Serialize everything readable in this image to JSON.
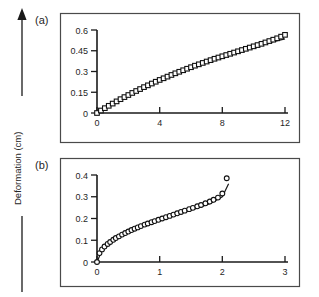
{
  "figure": {
    "shared_axis_label": "Deformation (cm)",
    "ink_color": "#1a1a1a",
    "frame_color": "#4a4a4a",
    "background": "#ffffff"
  },
  "panels": [
    {
      "letter": "(a)",
      "marker": "square",
      "yticklabels": [
        "0",
        "0.15",
        "0.3",
        "0.45",
        "0.6"
      ],
      "xticklabels": [
        "0",
        "4",
        "8",
        "12"
      ]
    },
    {
      "letter": "(b)",
      "marker": "circle",
      "yticklabels": [
        "0",
        "0.1",
        "0.2",
        "0.3",
        "0.4"
      ],
      "xticklabels": [
        "0",
        "1",
        "2",
        "3"
      ]
    }
  ],
  "chart_data": [
    {
      "type": "scatter",
      "title": "(a)",
      "xlabel": "",
      "ylabel": "Deformation (cm)",
      "xlim": [
        0,
        12
      ],
      "ylim": [
        0,
        0.6
      ],
      "xticks": [
        0,
        4,
        8,
        12
      ],
      "yticks": [
        0,
        0.15,
        0.3,
        0.45,
        0.6
      ],
      "grid": false,
      "legend": "none",
      "series": [
        {
          "name": "experimental data",
          "style": "open-square-markers",
          "x": [
            0,
            0.25,
            0.5,
            0.75,
            1,
            1.25,
            1.5,
            1.75,
            2,
            2.25,
            2.5,
            2.75,
            3,
            3.25,
            3.5,
            3.75,
            4,
            4.25,
            4.5,
            4.75,
            5,
            5.25,
            5.5,
            5.75,
            6,
            6.25,
            6.5,
            6.75,
            7,
            7.25,
            7.5,
            7.75,
            8,
            8.25,
            8.5,
            8.75,
            9,
            9.25,
            9.5,
            9.75,
            10,
            10.25,
            10.5,
            10.75,
            11,
            11.25,
            11.5,
            11.75,
            12
          ],
          "y": [
            0,
            0.018,
            0.035,
            0.052,
            0.068,
            0.084,
            0.1,
            0.115,
            0.13,
            0.145,
            0.159,
            0.173,
            0.187,
            0.2,
            0.213,
            0.226,
            0.239,
            0.251,
            0.263,
            0.275,
            0.287,
            0.298,
            0.309,
            0.32,
            0.331,
            0.342,
            0.352,
            0.362,
            0.372,
            0.382,
            0.392,
            0.401,
            0.41,
            0.419,
            0.428,
            0.437,
            0.446,
            0.455,
            0.464,
            0.473,
            0.482,
            0.491,
            0.5,
            0.51,
            0.52,
            0.53,
            0.54,
            0.552,
            0.565
          ]
        },
        {
          "name": "model fit",
          "style": "solid-line",
          "x": [
            0,
            1,
            2,
            3,
            4,
            5,
            6,
            7,
            8,
            9,
            10,
            11,
            12
          ],
          "y": [
            0,
            0.066,
            0.128,
            0.186,
            0.24,
            0.29,
            0.335,
            0.375,
            0.412,
            0.446,
            0.478,
            0.508,
            0.536
          ]
        }
      ]
    },
    {
      "type": "scatter",
      "title": "(b)",
      "xlabel": "",
      "ylabel": "Deformation (cm)",
      "xlim": [
        0,
        3
      ],
      "ylim": [
        0,
        0.4
      ],
      "xticks": [
        0,
        1,
        2,
        3
      ],
      "yticks": [
        0,
        0.1,
        0.2,
        0.3,
        0.4
      ],
      "grid": false,
      "legend": "none",
      "series": [
        {
          "name": "experimental data",
          "style": "open-circle-markers",
          "x": [
            0,
            0.04,
            0.08,
            0.12,
            0.17,
            0.21,
            0.26,
            0.3,
            0.35,
            0.4,
            0.45,
            0.5,
            0.55,
            0.6,
            0.65,
            0.7,
            0.76,
            0.81,
            0.87,
            0.92,
            0.98,
            1.04,
            1.1,
            1.16,
            1.22,
            1.28,
            1.34,
            1.4,
            1.47,
            1.53,
            1.6,
            1.66,
            1.73,
            1.8,
            1.86,
            1.93,
            2,
            2.07
          ],
          "y": [
            0,
            0.041,
            0.058,
            0.071,
            0.083,
            0.092,
            0.102,
            0.11,
            0.118,
            0.126,
            0.133,
            0.14,
            0.147,
            0.153,
            0.159,
            0.165,
            0.172,
            0.177,
            0.183,
            0.188,
            0.194,
            0.2,
            0.206,
            0.212,
            0.218,
            0.224,
            0.23,
            0.236,
            0.243,
            0.249,
            0.256,
            0.262,
            0.27,
            0.278,
            0.286,
            0.296,
            0.315,
            0.385
          ]
        },
        {
          "name": "model fit",
          "style": "solid-line",
          "x": [
            0,
            0.1,
            0.2,
            0.3,
            0.4,
            0.5,
            0.6,
            0.7,
            0.8,
            0.9,
            1,
            1.2,
            1.4,
            1.6,
            1.8,
            2,
            2.1
          ],
          "y": [
            0,
            0.067,
            0.094,
            0.112,
            0.127,
            0.14,
            0.152,
            0.163,
            0.174,
            0.184,
            0.194,
            0.212,
            0.23,
            0.248,
            0.268,
            0.3,
            0.36
          ]
        }
      ]
    }
  ]
}
